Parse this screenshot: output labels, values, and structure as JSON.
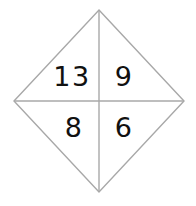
{
  "figure": {
    "name": "divided-diamond-number-puzzle",
    "background_color": "#ffffff",
    "width": 196,
    "height": 206,
    "line_color": "#a8a8a8",
    "line_width": 1.4,
    "text_color": "#111111",
    "shape": {
      "type": "diamond",
      "vertices": {
        "top": {
          "x": 99,
          "y": 10
        },
        "right": {
          "x": 184,
          "y": 101
        },
        "bottom": {
          "x": 99,
          "y": 192
        },
        "left": {
          "x": 14,
          "y": 101
        }
      },
      "center": {
        "x": 99,
        "y": 101
      },
      "dividers": [
        {
          "name": "vertical-divider",
          "x1": 99,
          "y1": 10,
          "x2": 99,
          "y2": 192
        },
        {
          "name": "horizontal-divider",
          "x1": 14,
          "y1": 101,
          "x2": 184,
          "y2": 101
        }
      ]
    },
    "cells": {
      "top_left": "13",
      "top_right": "9",
      "bottom_left": "8",
      "bottom_right": "6"
    }
  }
}
